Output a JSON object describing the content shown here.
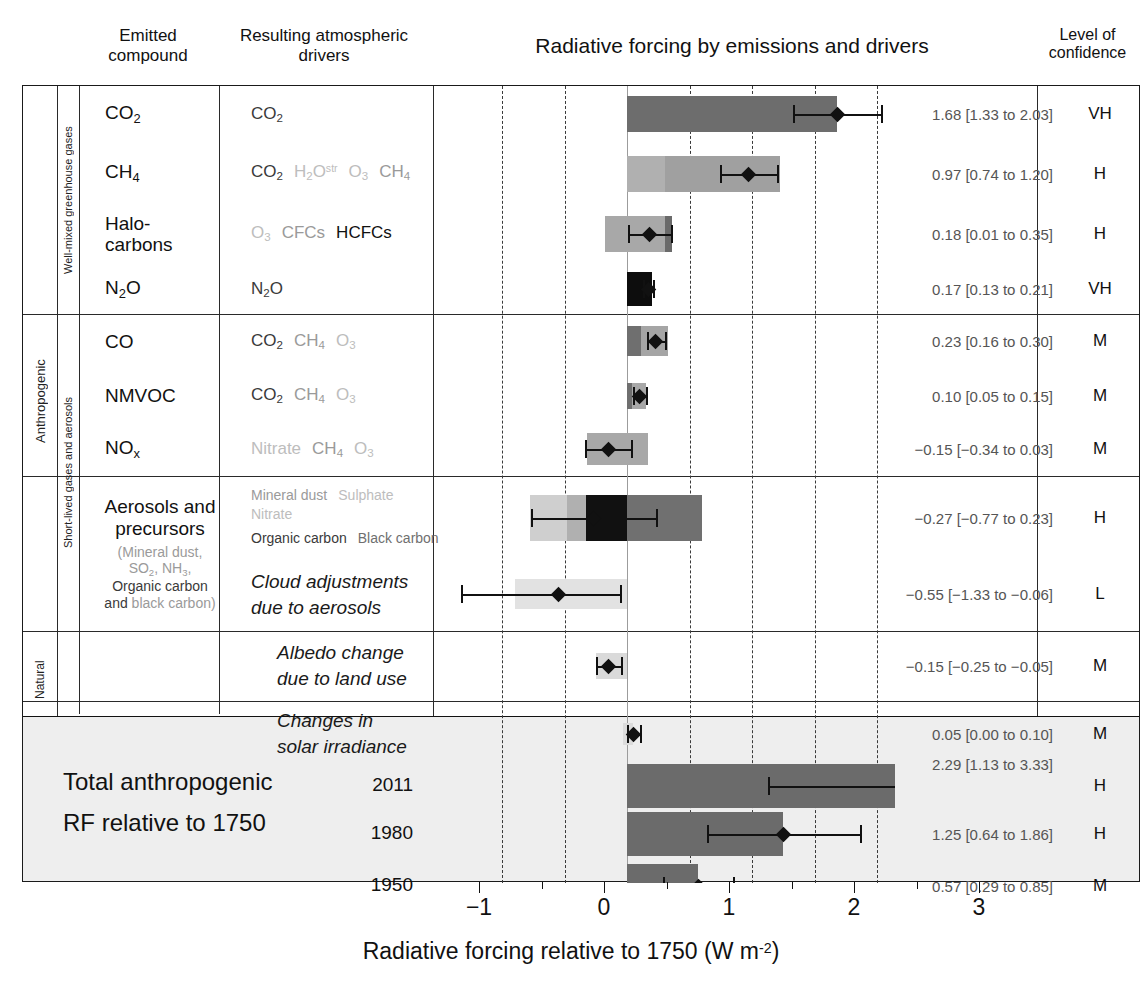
{
  "header": {
    "emitted": "Emitted\ncompound",
    "drivers": "Resulting atmospheric\ndrivers",
    "title": "Radiative forcing by emissions and drivers",
    "confidence": "Level of\nconfidence"
  },
  "side": {
    "anthropogenic": "Anthropogenic",
    "natural": "Natural",
    "wmgg": "Well-mixed greenhouse gases",
    "slga": "Short-lived gases and aerosols"
  },
  "total": {
    "line1": "Total anthropogenic",
    "line2": "RF relative to 1750",
    "years": [
      "2011",
      "1980",
      "1950"
    ]
  },
  "axis": {
    "ticks": [
      "-1",
      "0",
      "1",
      "2",
      "3"
    ],
    "tick_values": [
      -1,
      0,
      1,
      2,
      3
    ],
    "gridlines": [
      -1,
      -0.5,
      0.5,
      1,
      1.5,
      2
    ],
    "title": "Radiative forcing relative to 1750 (W m",
    "title_sup": "-2",
    "title_end": ")",
    "xlim": [
      -1.55,
      1.95
    ]
  },
  "chart_data": {
    "type": "bar",
    "title": "Radiative forcing by emissions and drivers",
    "xlabel": "Radiative forcing relative to 1750 (W m-2)",
    "ylabel": "",
    "xlim": [
      -1.55,
      1.95
    ],
    "grid": true,
    "legend": "none",
    "rows": [
      {
        "compound": "CO2",
        "value": 1.68,
        "low": 1.33,
        "high": 2.03,
        "value_text": "1.68 [1.33 to 2.03]",
        "confidence": "VH",
        "segments": [
          {
            "from": 0,
            "to": 1.68,
            "color": "#6d6d6d"
          }
        ]
      },
      {
        "compound": "CH4",
        "value": 0.97,
        "low": 0.74,
        "high": 1.2,
        "value_text": "0.97 [0.74 to 1.20]",
        "confidence": "H",
        "segments": [
          {
            "from": 0,
            "to": 0.3,
            "color": "#b0b0b0"
          },
          {
            "from": 0.3,
            "to": 1.22,
            "color": "#a0a0a0"
          }
        ]
      },
      {
        "compound": "Halocarbons",
        "value": 0.18,
        "low": 0.01,
        "high": 0.35,
        "value_text": "0.18 [0.01 to 0.35]",
        "confidence": "H",
        "segments": [
          {
            "from": -0.18,
            "to": 0.3,
            "color": "#a8a8a8"
          },
          {
            "from": 0.3,
            "to": 0.36,
            "color": "#6a6a6a"
          }
        ]
      },
      {
        "compound": "N2O",
        "value": 0.17,
        "low": 0.13,
        "high": 0.21,
        "value_text": "0.17 [0.13 to 0.21]",
        "confidence": "VH",
        "segments": [
          {
            "from": 0,
            "to": 0.2,
            "color": "#0d0d0d"
          }
        ]
      },
      {
        "compound": "CO",
        "value": 0.23,
        "low": 0.16,
        "high": 0.3,
        "value_text": "0.23 [0.16 to 0.30]",
        "confidence": "M",
        "segments": [
          {
            "from": 0,
            "to": 0.11,
            "color": "#6f6f6f"
          },
          {
            "from": 0.11,
            "to": 0.33,
            "color": "#a5a5a5"
          }
        ]
      },
      {
        "compound": "NMVOC",
        "value": 0.1,
        "low": 0.05,
        "high": 0.15,
        "value_text": "0.10 [0.05 to 0.15]",
        "confidence": "M",
        "segments": [
          {
            "from": 0,
            "to": 0.04,
            "color": "#6f6f6f"
          },
          {
            "from": 0.04,
            "to": 0.15,
            "color": "#a8a8a8"
          }
        ]
      },
      {
        "compound": "NOx",
        "value": -0.15,
        "low": -0.34,
        "high": 0.03,
        "value_text": "-0.15 [-0.34 to 0.03]",
        "confidence": "M",
        "segments": [
          {
            "from": -0.32,
            "to": 0.17,
            "color": "#a8a8a8"
          }
        ]
      },
      {
        "compound": "Aerosols and precursors",
        "value": -0.27,
        "low": -0.77,
        "high": 0.23,
        "value_text": "-0.27 [-0.77 to 0.23]",
        "confidence": "H",
        "segments": [
          {
            "from": -0.78,
            "to": -0.48,
            "color": "#cfcfcf"
          },
          {
            "from": -0.48,
            "to": -0.33,
            "color": "#b0b0b0"
          },
          {
            "from": -0.33,
            "to": 0.0,
            "color": "#111111"
          },
          {
            "from": 0.0,
            "to": 0.6,
            "color": "#707070"
          }
        ]
      },
      {
        "compound": "Cloud adjustments due to aerosols",
        "value": -0.55,
        "low": -1.33,
        "high": -0.06,
        "value_text": "-0.55 [-1.33 to -0.06]",
        "confidence": "L",
        "segments": [
          {
            "from": -0.9,
            "to": 0.0,
            "color": "#e2e2e2"
          }
        ]
      },
      {
        "compound": "Albedo change due to land use",
        "value": -0.15,
        "low": -0.25,
        "high": -0.05,
        "value_text": "-0.15 [-0.25 to -0.05]",
        "confidence": "M",
        "segments": [
          {
            "from": -0.25,
            "to": 0.0,
            "color": "#dadada"
          }
        ]
      },
      {
        "compound": "Changes in solar irradiance",
        "value": 0.05,
        "low": 0.0,
        "high": 0.1,
        "value_text": "0.05 [0.00 to 0.10]",
        "confidence": "M",
        "segments": [
          {
            "from": -0.03,
            "to": 0.05,
            "color": "#dcdcdc"
          }
        ]
      },
      {
        "compound": "2011",
        "value": 2.29,
        "low": 1.13,
        "high": 3.33,
        "value_text": "2.29 [1.13 to 3.33]",
        "confidence": "H",
        "segments": [
          {
            "from": 0,
            "to": 2.29,
            "color": "#6b6b6b"
          }
        ]
      },
      {
        "compound": "1980",
        "value": 1.25,
        "low": 0.64,
        "high": 1.86,
        "value_text": "1.25 [0.64 to 1.86]",
        "confidence": "H",
        "segments": [
          {
            "from": 0,
            "to": 1.25,
            "color": "#6b6b6b"
          }
        ]
      },
      {
        "compound": "1950",
        "value": 0.57,
        "low": 0.29,
        "high": 0.85,
        "value_text": "0.57 [0.29 to 0.85]",
        "confidence": "M",
        "segments": [
          {
            "from": 0,
            "to": 0.57,
            "color": "#6b6b6b"
          }
        ]
      }
    ]
  },
  "rows_text": [
    {
      "emit": "CO2",
      "drivers": "CO2"
    },
    {
      "emit": "CH4",
      "drivers": "CO2 H2Ostr O3 CH4"
    },
    {
      "emit": "Halo-carbons",
      "drivers": "O3 CFCs HCFCs"
    },
    {
      "emit": "N2O",
      "drivers": "N2O"
    },
    {
      "emit": "CO",
      "drivers": "CO2 CH4 O3"
    },
    {
      "emit": "NMVOC",
      "drivers": "CO2 CH4 O3"
    },
    {
      "emit": "NOx",
      "drivers": "Nitrate CH4 O3"
    },
    {
      "emit": "Aerosols and precursors (Mineral dust, SO2, NH3, Organic carbon and black carbon)",
      "drivers": "Mineral dust Sulphate Nitrate Organic carbon Black carbon"
    },
    {
      "emit": "",
      "drivers": "Cloud adjustments due to aerosols"
    },
    {
      "emit": "",
      "drivers": "Albedo change due to land use"
    },
    {
      "emit": "",
      "drivers": "Changes in solar irradiance"
    }
  ],
  "aerosol_sub": {
    "l1": "(Mineral dust,",
    "l2": "SO2, NH3,",
    "l3": "Organic carbon",
    "l4": "and black carbon)"
  },
  "drv_aerosol": {
    "l1a": "Mineral dust",
    "l1b": "Sulphate",
    "l1c": "Nitrate",
    "l2a": "Organic carbon",
    "l2b": "Black carbon"
  },
  "cloud_text": {
    "l1": "Cloud adjustments",
    "l2": "due to aerosols"
  },
  "albedo_text": {
    "l1": "Albedo change",
    "l2": "due to land use"
  },
  "solar_text": {
    "l1": "Changes in",
    "l2": "solar irradiance"
  },
  "colors": {
    "co2_bar": "#6d6d6d",
    "n2o_bar": "#0d0d0d",
    "total_bar": "#6b6b6b",
    "total_bg": "#eeeeee",
    "value_text": "#555555",
    "grid": "#3a3a3a"
  }
}
